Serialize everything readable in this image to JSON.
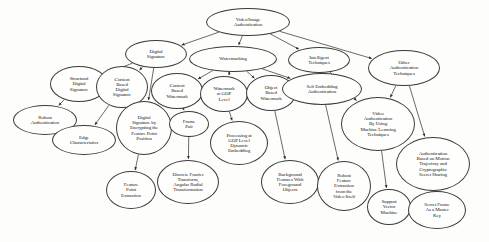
{
  "diagram": {
    "type": "tree",
    "orientation": "top-down",
    "node_shape": "ellipse",
    "colors": {
      "background": "#fdfdfb",
      "node_fill": "#fefefd",
      "node_stroke": "#3a3a3a",
      "edge_stroke": "#2b2b2b",
      "text": "#1a1a1a"
    },
    "nodes": [
      {
        "id": "root",
        "label": "Video/Image\nAuthentication",
        "cx": 248,
        "cy": 22,
        "rx": 42,
        "ry": 14,
        "fs": 5.0
      },
      {
        "id": "ds",
        "label": "Digital\nSignature",
        "cx": 156,
        "cy": 54,
        "rx": 31,
        "ry": 14,
        "fs": 5.0
      },
      {
        "id": "wm",
        "label": "Watermarking",
        "cx": 233,
        "cy": 59,
        "rx": 44,
        "ry": 13,
        "fs": 5.0
      },
      {
        "id": "it",
        "label": "Intelligent\nTechniques",
        "cx": 319,
        "cy": 60,
        "rx": 31,
        "ry": 13,
        "fs": 5.0
      },
      {
        "id": "oat",
        "label": "Other\nAuthentication\nTechniques",
        "cx": 404,
        "cy": 68,
        "rx": 36,
        "ry": 18,
        "fs": 5.0
      },
      {
        "id": "sds",
        "label": "Structural\nDigital\nSignature",
        "cx": 79,
        "cy": 84,
        "rx": 29,
        "ry": 18,
        "fs": 5.0
      },
      {
        "id": "cbds",
        "label": "Content\nBased\nDigital\nSignature",
        "cx": 122,
        "cy": 87,
        "rx": 26,
        "ry": 21,
        "fs": 5.0
      },
      {
        "id": "cbw",
        "label": "Content\nBased\nWatermark",
        "cx": 177,
        "cy": 91,
        "rx": 26,
        "ry": 18,
        "fs": 5.0
      },
      {
        "id": "wgop",
        "label": "Watermark\nat GOP\nLevel",
        "cx": 224,
        "cy": 94,
        "rx": 24,
        "ry": 18,
        "fs": 5.0
      },
      {
        "id": "obw",
        "label": "Object\nBased\nWatermark",
        "cx": 271,
        "cy": 93,
        "rx": 25,
        "ry": 18,
        "fs": 5.0
      },
      {
        "id": "sea",
        "label": "Self Embedding\nAuthentication",
        "cx": 322,
        "cy": 89,
        "rx": 40,
        "ry": 16,
        "fs": 5.0
      },
      {
        "id": "ra",
        "label": "Robust\nAuthentication",
        "cx": 45,
        "cy": 120,
        "rx": 32,
        "ry": 15,
        "fs": 5.0
      },
      {
        "id": "ec",
        "label": "Edge\nCharacteristics",
        "cx": 84,
        "cy": 140,
        "rx": 32,
        "ry": 15,
        "fs": 5.0
      },
      {
        "id": "dsefpp",
        "label": "Digital\nSignature by\nEncrypting the\nFeature Point\nPosition",
        "cx": 144,
        "cy": 128,
        "rx": 28,
        "ry": 27,
        "fs": 5.0
      },
      {
        "id": "fp",
        "label": "Frame\nPair",
        "cx": 189,
        "cy": 124,
        "rx": 20,
        "ry": 13,
        "fs": 5.0
      },
      {
        "id": "pgde",
        "label": "Processing at\nGOP Level\nDynamic\nEmbedding",
        "cx": 239,
        "cy": 143,
        "rx": 29,
        "ry": 22,
        "fs": 5.0
      },
      {
        "id": "vaml",
        "label": "Video\nAuthentication\nBy Using\nMachine Learning\nTechniques",
        "cx": 378,
        "cy": 124,
        "rx": 37,
        "ry": 27,
        "fs": 5.0
      },
      {
        "id": "ambmtcss",
        "label": "Authentication\nBased on Motion\nTrajectory and\nCryptographic\nSecret Sharing",
        "cx": 433,
        "cy": 164,
        "rx": 37,
        "ry": 27,
        "fs": 5.0
      },
      {
        "id": "bffo",
        "label": "Background\nFeatures With\nForeground\nObjects",
        "cx": 290,
        "cy": 182,
        "rx": 29,
        "ry": 22,
        "fs": 5.0
      },
      {
        "id": "rfevi",
        "label": "Robust\nFeature\nExtraction\nfrom the\nVideo Itself",
        "cx": 344,
        "cy": 186,
        "rx": 27,
        "ry": 25,
        "fs": 5.0
      },
      {
        "id": "fpe",
        "label": "Feature\nPoint\nExtraction",
        "cx": 131,
        "cy": 190,
        "rx": 25,
        "ry": 19,
        "fs": 5.0
      },
      {
        "id": "dftart",
        "label": "Discrete Fourier\nTransform,\nAngular Radial\nTransformation",
        "cx": 188,
        "cy": 182,
        "rx": 31,
        "ry": 22,
        "fs": 5.0
      },
      {
        "id": "svm",
        "label": "Support\nVector\nMachine",
        "cx": 389,
        "cy": 207,
        "rx": 22,
        "ry": 18,
        "fs": 5.0
      },
      {
        "id": "sfmk",
        "label": "Secret Frame\nAs a Master\nKey",
        "cx": 437,
        "cy": 210,
        "rx": 29,
        "ry": 19,
        "fs": 5.0
      }
    ],
    "edges": [
      {
        "from": "root",
        "to": "ds"
      },
      {
        "from": "root",
        "to": "wm"
      },
      {
        "from": "root",
        "to": "it"
      },
      {
        "from": "root",
        "to": "oat"
      },
      {
        "from": "ds",
        "to": "sds"
      },
      {
        "from": "ds",
        "to": "cbds"
      },
      {
        "from": "ds",
        "to": "dsefpp"
      },
      {
        "from": "sds",
        "to": "ra"
      },
      {
        "from": "cbds",
        "to": "ec"
      },
      {
        "from": "wm",
        "to": "cbw"
      },
      {
        "from": "wm",
        "to": "wgop"
      },
      {
        "from": "wm",
        "to": "obw"
      },
      {
        "from": "wm",
        "to": "sea"
      },
      {
        "from": "cbw",
        "to": "fp"
      },
      {
        "from": "wgop",
        "to": "pgde"
      },
      {
        "from": "obw",
        "to": "bffo"
      },
      {
        "from": "it",
        "to": "sea"
      },
      {
        "from": "sea",
        "to": "rfevi"
      },
      {
        "from": "it",
        "to": "vaml"
      },
      {
        "from": "oat",
        "to": "vaml"
      },
      {
        "from": "oat",
        "to": "ambmtcss"
      },
      {
        "from": "dsefpp",
        "to": "fpe"
      },
      {
        "from": "fp",
        "to": "dftart"
      },
      {
        "from": "vaml",
        "to": "svm"
      },
      {
        "from": "ambmtcss",
        "to": "sfmk"
      }
    ]
  }
}
